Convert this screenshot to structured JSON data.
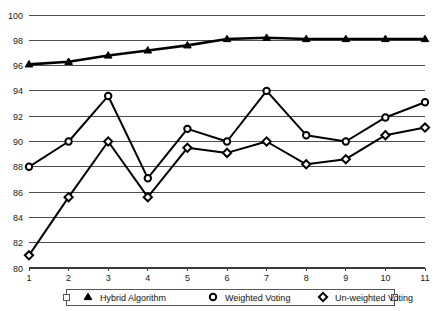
{
  "chart_data": {
    "type": "line",
    "title": "",
    "xlabel": "",
    "ylabel": "",
    "categories": [
      "1",
      "2",
      "3",
      "4",
      "5",
      "6",
      "7",
      "8",
      "9",
      "10",
      "11"
    ],
    "x": [
      1,
      2,
      3,
      4,
      5,
      6,
      7,
      8,
      9,
      10,
      11
    ],
    "xlim": [
      1,
      11
    ],
    "ylim": [
      80,
      100
    ],
    "y_ticks": [
      80,
      82,
      84,
      86,
      88,
      90,
      92,
      94,
      96,
      98,
      100
    ],
    "x_ticks": [
      1,
      2,
      3,
      4,
      5,
      6,
      7,
      8,
      9,
      10,
      11
    ],
    "grid": "horizontal",
    "legend_position": "bottom",
    "series": [
      {
        "name": "Hybrid Algorithm",
        "marker": "triangle-filled",
        "color": "#000000",
        "values": [
          96.1,
          96.3,
          96.8,
          97.2,
          97.6,
          98.1,
          98.2,
          98.1,
          98.1,
          98.1,
          98.1
        ]
      },
      {
        "name": "Weighted Voting",
        "marker": "circle-open",
        "color": "#000000",
        "values": [
          88.0,
          90.0,
          93.6,
          87.1,
          91.0,
          90.0,
          94.0,
          90.5,
          90.0,
          91.9,
          93.1
        ]
      },
      {
        "name": "Un-weighted Voting",
        "marker": "diamond-open",
        "color": "#000000",
        "values": [
          81.0,
          85.6,
          90.0,
          85.6,
          89.5,
          89.1,
          90.0,
          88.2,
          88.6,
          90.5,
          91.1
        ]
      }
    ]
  },
  "legend": {
    "items": [
      {
        "label": "Hybrid Algorithm",
        "marker": "triangle-filled"
      },
      {
        "label": "Weighted Voting",
        "marker": "circle-open"
      },
      {
        "label": "Un-weighted Voting",
        "marker": "diamond-open"
      }
    ]
  },
  "axis": {
    "y_tick_labels": [
      "100",
      "98",
      "96",
      "94",
      "92",
      "90",
      "88",
      "86",
      "84",
      "82",
      "80"
    ],
    "x_tick_labels": [
      "1",
      "2",
      "3",
      "4",
      "5",
      "6",
      "7",
      "8",
      "9",
      "10",
      "11"
    ]
  }
}
